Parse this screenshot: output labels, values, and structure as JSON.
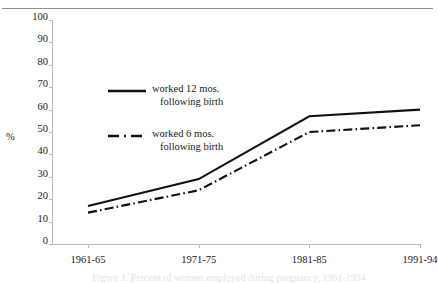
{
  "figure": {
    "top_rule": true
  },
  "chart_data": {
    "type": "line",
    "title": "",
    "xlabel": "",
    "ylabel": "%",
    "categories": [
      "1961-65",
      "1971-75",
      "1981-85",
      "1991-94"
    ],
    "ylim": [
      0,
      100
    ],
    "yticks": [
      0,
      10,
      20,
      30,
      40,
      50,
      60,
      70,
      80,
      90,
      100
    ],
    "grid": false,
    "legend_position": "inside-upper-left",
    "series": [
      {
        "name": "worked 12 mos. following birth",
        "style": "solid",
        "color": "#111111",
        "values": [
          17,
          29,
          57,
          60
        ]
      },
      {
        "name": "worked 6 mos. following birth",
        "style": "dash-dot",
        "color": "#111111",
        "values": [
          14,
          24,
          50,
          53
        ]
      }
    ]
  },
  "legend": {
    "entries": [
      {
        "line1": "worked 12 mos.",
        "line2": "following birth",
        "style": "solid"
      },
      {
        "line1": "worked 6 mos.",
        "line2": "following birth",
        "style": "dash-dot"
      }
    ]
  },
  "caption": {
    "text": "Figure 1. Percent of women employed during pregnancy, 1961-1994"
  }
}
